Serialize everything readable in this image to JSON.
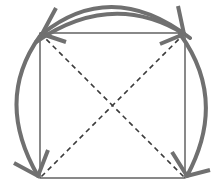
{
  "diagram": {
    "colors": {
      "square": "#4a4a4a",
      "diagonals": "#3c3c3c",
      "arrows": "#707070",
      "background": "#ffffff"
    },
    "square": {
      "corners": {
        "top_left": [
          40,
          33
        ],
        "top_right": [
          185,
          33
        ],
        "bottom_left": [
          40,
          178
        ],
        "bottom_right": [
          185,
          178
        ]
      }
    },
    "diagonals": [
      {
        "from": "top_left",
        "to": "bottom_right",
        "style": "dashed"
      },
      {
        "from": "top_right",
        "to": "bottom_left",
        "style": "dashed"
      }
    ],
    "arrows": [
      {
        "name": "top-arc-to-top-left",
        "ends_at": "top_left"
      },
      {
        "name": "top-arc-to-top-right",
        "ends_at": "top_right"
      },
      {
        "name": "left-arc-to-bottom-left",
        "from": "top_left",
        "ends_at": "bottom_left"
      },
      {
        "name": "right-arc-to-bottom-right",
        "from": "top_right",
        "ends_at": "bottom_right"
      }
    ]
  }
}
